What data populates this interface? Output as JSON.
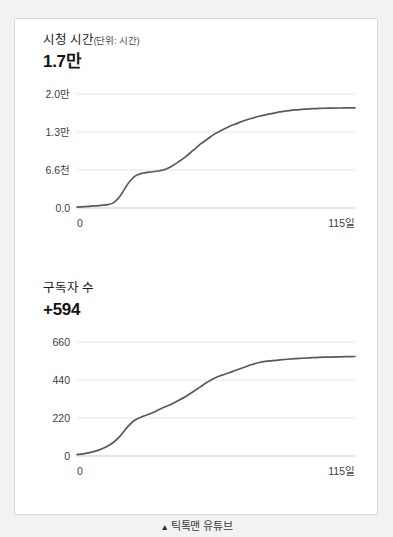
{
  "card": {
    "panels": [
      {
        "title": "시청 시간",
        "unit": "(단위: 시간)",
        "value": "1.7만",
        "name": "watch-time"
      },
      {
        "title": "구독자 수",
        "unit": "",
        "value": "+594",
        "name": "subscribers"
      }
    ]
  },
  "footer": {
    "marker": "▲",
    "label": "틱톡맨 유튜브"
  },
  "colors": {
    "background": "#f2f2f2",
    "card": "#ffffff",
    "card_border": "#d8d8d8",
    "line": "#59595b",
    "grid": "#e3e3e3",
    "axis": "#c9c9c9",
    "text": "#1a1a1a",
    "tick_text": "#3d3d3d"
  },
  "chart_data": [
    {
      "type": "line",
      "name": "watch-time-chart",
      "title": "시청 시간",
      "subtitle": "(단위: 시간)",
      "xlabel": "",
      "ylabel": "",
      "grid": true,
      "legend": false,
      "xlim": [
        0,
        115
      ],
      "ylim": [
        0,
        20000
      ],
      "ytick_labels": [
        "2.0만",
        "1.3만",
        "6.6천",
        "0.0"
      ],
      "ytick_values": [
        20000,
        13300,
        6600,
        0
      ],
      "xtick_labels": [
        "0",
        "115일"
      ],
      "xtick_values": [
        0,
        115
      ],
      "x": [
        0,
        3,
        6,
        9,
        12,
        15,
        18,
        21,
        24,
        27,
        30,
        33,
        36,
        39,
        42,
        45,
        48,
        51,
        54,
        57,
        60,
        63,
        66,
        69,
        72,
        75,
        78,
        81,
        84,
        87,
        90,
        93,
        96,
        99,
        102,
        105,
        108,
        111,
        115
      ],
      "values": [
        150,
        230,
        330,
        430,
        560,
        900,
        2200,
        4200,
        5600,
        6100,
        6300,
        6450,
        6700,
        7300,
        8100,
        9000,
        10100,
        11200,
        12100,
        13000,
        13700,
        14300,
        14800,
        15300,
        15700,
        16050,
        16350,
        16600,
        16850,
        17050,
        17200,
        17300,
        17400,
        17450,
        17500,
        17520,
        17540,
        17560,
        17580
      ]
    },
    {
      "type": "line",
      "name": "subscribers-chart",
      "title": "구독자 수",
      "subtitle": "",
      "xlabel": "",
      "ylabel": "",
      "grid": true,
      "legend": false,
      "xlim": [
        0,
        115
      ],
      "ylim": [
        0,
        660
      ],
      "ytick_labels": [
        "660",
        "440",
        "220",
        "0"
      ],
      "ytick_values": [
        660,
        440,
        220,
        0
      ],
      "xtick_labels": [
        "0",
        "115일"
      ],
      "xtick_values": [
        0,
        115
      ],
      "x": [
        0,
        3,
        6,
        9,
        12,
        15,
        18,
        21,
        24,
        27,
        30,
        33,
        36,
        39,
        42,
        45,
        48,
        51,
        54,
        57,
        60,
        63,
        66,
        69,
        72,
        75,
        78,
        81,
        84,
        87,
        90,
        93,
        96,
        99,
        102,
        105,
        108,
        111,
        115
      ],
      "values": [
        8,
        14,
        22,
        34,
        52,
        78,
        118,
        170,
        208,
        228,
        243,
        262,
        282,
        300,
        322,
        345,
        372,
        400,
        428,
        452,
        468,
        482,
        498,
        512,
        528,
        540,
        548,
        552,
        556,
        560,
        564,
        566,
        568,
        570,
        572,
        573,
        574,
        575,
        576
      ]
    }
  ]
}
